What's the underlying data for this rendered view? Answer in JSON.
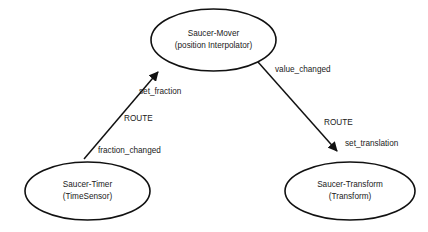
{
  "diagram": {
    "type": "routing-graph",
    "title": "",
    "background_color": "#ffffff",
    "stroke_color": "#111111",
    "text_color": "#1a1a1a",
    "nodes": [
      {
        "id": "saucer-mover",
        "shape": "ellipse",
        "line1": "Saucer-Mover",
        "line2": "(position Interpolator)",
        "cx": 213.5,
        "cy": 40,
        "rx": 62.5,
        "ry": 31
      },
      {
        "id": "saucer-timer",
        "shape": "ellipse",
        "line1": "Saucer-Timer",
        "line2": "(TimeSensor)",
        "cx": 87.5,
        "cy": 191,
        "rx": 62.5,
        "ry": 29
      },
      {
        "id": "saucer-transform",
        "shape": "ellipse",
        "line1": "Saucer-Transform",
        "line2": "(Transform)",
        "cx": 350,
        "cy": 191,
        "rx": 65,
        "ry": 29
      }
    ],
    "edges": [
      {
        "id": "route-timer-to-mover",
        "from": "saucer-timer",
        "to": "saucer-mover",
        "route_label": "ROUTE",
        "source_field": "fraction_changed",
        "target_field": "set_fraction",
        "arrowhead": "at-target"
      },
      {
        "id": "route-mover-to-transform",
        "from": "saucer-mover",
        "to": "saucer-transform",
        "route_label": "ROUTE",
        "source_field": "value_changed",
        "target_field": "set_translation",
        "arrowhead": "at-target"
      }
    ],
    "labels": {
      "set_fraction": "set_fraction",
      "fraction_changed": "fraction_changed",
      "route_left": "ROUTE",
      "value_changed": "value_changed",
      "set_translation": "set_translation",
      "route_right": "ROUTE"
    }
  }
}
